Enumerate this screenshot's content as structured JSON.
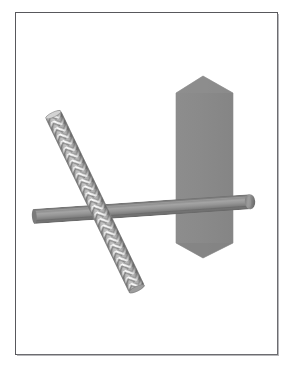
{
  "figure": {
    "title": "Technical 3D rendering of a hexagonal prism with a crossing cylinder and a threaded rod",
    "caption": "",
    "background_color": "#ffffff",
    "frame": {
      "border_color": "#58585c",
      "shadow_color": "#7d7d82",
      "x": 15,
      "y": 12,
      "width": 263,
      "height": 343
    },
    "objects": [
      {
        "name": "hexagonal-prism",
        "kind": "hexagon",
        "fill_color": "#8a8a8a",
        "edge_color": "#8a8a8a",
        "apex_top": [
          203,
          76
        ],
        "apex_bottom": [
          203,
          258
        ],
        "left_x": 176,
        "right_x": 233,
        "shoulder_top_y": 93,
        "shoulder_bottom_y": 243
      },
      {
        "name": "horizontal-cylinder",
        "kind": "cylinder",
        "fill_color": "#8b8b8b",
        "highlight_color": "#a8a8a8",
        "shadow_color": "#6f6f6f",
        "start": [
          34,
          216
        ],
        "end": [
          241,
          202
        ],
        "diameter": 15
      },
      {
        "name": "threaded-rod",
        "kind": "textured-cylinder",
        "fill_color": "#b4b4b4",
        "highlight_color": "#f2f2f2",
        "shadow_color": "#6a6a6a",
        "start": [
          52,
          121
        ],
        "end": [
          136,
          294
        ],
        "diameter": 17,
        "texture": "chevron-thread"
      }
    ],
    "palette": {
      "gray_mid": "#8a8a8a",
      "gray_light": "#c9c9c9",
      "gray_dark": "#6a6a6a",
      "white": "#ffffff",
      "frame": "#58585c"
    }
  }
}
